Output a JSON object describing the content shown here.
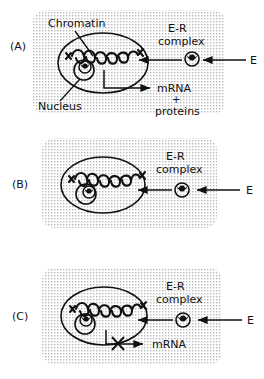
{
  "figure": {
    "background_color": "#ffffff",
    "ink_color": "#111111",
    "panel_fill_color": "#e8e8e8",
    "panel_texture": "stipple-dots",
    "panel_count": 3
  },
  "panels": [
    {
      "id": "A",
      "letter": "(A)",
      "description": "E-R complex enters nucleus, binds chromatin, transcription proceeds",
      "labels": {
        "chromatin": "Chromatin",
        "nucleus": "Nucleus",
        "er_complex_line1": "E-R",
        "er_complex_line2": "complex",
        "estrogen": "E",
        "output_line1": "mRNA",
        "output_line2": "+",
        "output_line3": "proteins"
      },
      "has_chromatin_label": true,
      "has_nucleus_label": true,
      "has_output": true,
      "transcription_blocked": false,
      "block_mark": ""
    },
    {
      "id": "B",
      "letter": "(B)",
      "description": "E-R complex outside cell, receptor unbound in nucleus, no transcription",
      "labels": {
        "chromatin": "",
        "nucleus": "",
        "er_complex_line1": "E-R",
        "er_complex_line2": "complex",
        "estrogen": "E",
        "output_line1": "",
        "output_line2": "",
        "output_line3": ""
      },
      "has_chromatin_label": false,
      "has_nucleus_label": false,
      "has_output": false,
      "transcription_blocked": false,
      "block_mark": ""
    },
    {
      "id": "C",
      "letter": "(C)",
      "description": "E-R complex binds chromatin but mRNA transcription is blocked",
      "labels": {
        "chromatin": "",
        "nucleus": "",
        "er_complex_line1": "E-R",
        "er_complex_line2": "complex",
        "estrogen": "E",
        "output_line1": "mRNA",
        "output_line2": "",
        "output_line3": ""
      },
      "has_chromatin_label": false,
      "has_nucleus_label": false,
      "has_output": true,
      "transcription_blocked": true,
      "block_mark": "X"
    }
  ],
  "icons": {
    "cell": "cell-outline-ellipse",
    "nucleus": "nucleus-circle",
    "chromatin": "chromatin-coil",
    "receptor": "receptor-circle-notch",
    "arrow": "arrow-left",
    "block": "x-cross"
  }
}
